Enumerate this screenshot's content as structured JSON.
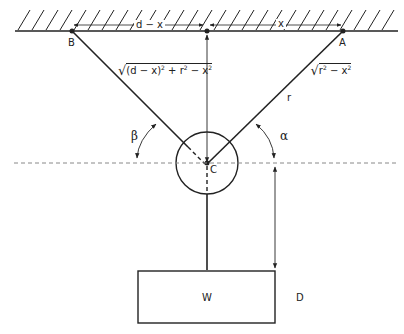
{
  "diagram": {
    "points": {
      "B": "B",
      "A": "A",
      "C": "C"
    },
    "labels": {
      "d_minus_x": "d − x",
      "x": "x",
      "length_BC_expr": "(d − x)",
      "length_BC_expr_tail": " + r",
      "length_BC_expr_tail2": " − x",
      "length_mid_r": "r",
      "length_mid_tail": " − x",
      "r": "r",
      "beta": "β",
      "alpha": "α",
      "l_minus": "l − ",
      "weight": "W",
      "D": "D",
      "sup2": "2"
    },
    "colors": {
      "stroke": "#222222",
      "dashed": "#888888",
      "background": "#ffffff"
    }
  }
}
